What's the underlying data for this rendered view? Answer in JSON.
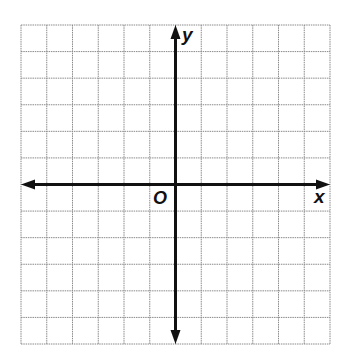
{
  "diagram": {
    "type": "coordinate-plane",
    "grid": {
      "columns": 12,
      "rows": 12,
      "left": 21,
      "top": 25,
      "right": 330,
      "bottom": 344,
      "line_color": "#8a8a8a",
      "line_style": "dotted"
    },
    "axes": {
      "color": "#111111",
      "x_axis_row": 6,
      "y_axis_col": 6
    },
    "labels": {
      "x_axis": "x",
      "y_axis": "y",
      "origin": "O"
    }
  }
}
